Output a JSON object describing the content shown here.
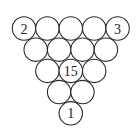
{
  "diagram": {
    "rows": [
      [
        "2",
        "",
        "",
        "",
        "3"
      ],
      [
        "",
        "",
        "",
        ""
      ],
      [
        "",
        "15",
        ""
      ],
      [
        "",
        ""
      ],
      [
        "1"
      ]
    ],
    "colors": {
      "stroke": "#2a2a2a",
      "fill": "#ffffff",
      "text": "#222222"
    }
  }
}
